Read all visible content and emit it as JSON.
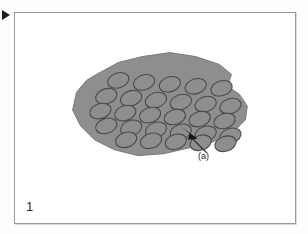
{
  "document": {
    "kind": "patent-style-figure-scan",
    "page_background": "#fdfdfc",
    "frame_border_color": "#9a9a9a"
  },
  "margin_marker": {
    "icon": "right-pointing-triangle-icon",
    "color": "#1b1b1b"
  },
  "figure": {
    "number": "1",
    "caption_label": "1",
    "callouts": [
      {
        "label": "(a)",
        "points_to": "edge-of-shaded-region",
        "arrow_tip": [
          171,
          118
        ],
        "arrow_tail": [
          191,
          140
        ]
      }
    ],
    "illustration": {
      "name": "shaded-irregular-region-with-ellipse-array",
      "fill_color": "#8e8e8e",
      "outline_color": "#7a7a7a",
      "ellipse_outline_color": "#4a4a4a",
      "ellipse_count": 30,
      "outline_points": "82,62 104,50 128,44 156,40 182,44 206,52 218,62 214,74 226,82 234,94 232,108 220,120 200,130 176,136 150,142 124,144 100,138 80,128 66,114 58,98 62,80 72,68",
      "ellipse_rotation_deg": -18,
      "ellipse_rx": 11,
      "ellipse_ry": 7.5,
      "rows": [
        {
          "row": 1,
          "cx_start": 104,
          "cy_start": 68,
          "count": 5,
          "dx": 26,
          "dy": 2
        },
        {
          "row": 2,
          "cx_start": 92,
          "cy_start": 84,
          "count": 6,
          "dx": 25,
          "dy": 2
        },
        {
          "row": 3,
          "cx_start": 86,
          "cy_start": 99,
          "count": 6,
          "dx": 25,
          "dy": 2
        },
        {
          "row": 4,
          "cx_start": 92,
          "cy_start": 114,
          "count": 6,
          "dx": 25,
          "dy": 2
        },
        {
          "row": 5,
          "cx_start": 112,
          "cy_start": 128,
          "count": 5,
          "dx": 25,
          "dy": 1
        }
      ]
    }
  },
  "chart_data": {
    "type": "diagram",
    "title": "1",
    "annotations": [
      "(a)"
    ],
    "element_counts": {
      "shaded_regions": 1,
      "ellipses": 30
    }
  }
}
